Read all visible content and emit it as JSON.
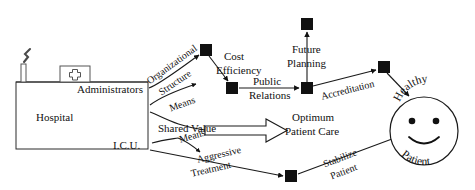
{
  "diagram": {
    "type": "causal-flow-diagram",
    "background_color": "#ffffff",
    "line_color": "#1a1a1a",
    "node_color": "#111111",
    "building": {
      "name": "hospital-building",
      "label": "Hospital",
      "departments": [
        {
          "key": "administrators",
          "label": "Administrators"
        },
        {
          "key": "icu",
          "label": "I.C.U."
        }
      ],
      "roof_sign_label": "cross-sign",
      "chimney_label": "chimney-with-smoke"
    },
    "nodes": [
      {
        "id": "n1",
        "name": "node-organizational-structure",
        "x": 206,
        "y": 50
      },
      {
        "id": "n2",
        "name": "node-cost-efficiency",
        "x": 232,
        "y": 88
      },
      {
        "id": "n3",
        "name": "node-public-relations",
        "x": 307,
        "y": 88
      },
      {
        "id": "n4",
        "name": "node-future-planning",
        "x": 307,
        "y": 24
      },
      {
        "id": "n5",
        "name": "node-accreditation",
        "x": 384,
        "y": 67
      },
      {
        "id": "n6",
        "name": "node-aggressive-treatment",
        "x": 291,
        "y": 176
      }
    ],
    "edge_labels": [
      {
        "key": "organizational_structure",
        "line1": "Organizational",
        "line2": "Structure"
      },
      {
        "key": "means_upper",
        "text": "Means"
      },
      {
        "key": "cost_efficiency",
        "line1": "Cost",
        "line2": "Efficiency"
      },
      {
        "key": "public_relations",
        "line1": "Public",
        "line2": "Relations"
      },
      {
        "key": "future_planning",
        "line1": "Future",
        "line2": "Planning"
      },
      {
        "key": "accreditation",
        "text": "Accreditation"
      },
      {
        "key": "shared_value",
        "text": "Shared Value"
      },
      {
        "key": "optimum_patient_care",
        "line1": "Optimum",
        "line2": "Patient Care"
      },
      {
        "key": "means_lower",
        "text": "Means"
      },
      {
        "key": "aggressive_treatment",
        "line1": "Aggressive",
        "line2": "Treatment"
      },
      {
        "key": "stabilize_patient",
        "line1": "Stabilize",
        "line2": "Patient"
      }
    ],
    "outcome": {
      "name": "patient-outcome",
      "face_label": "smiley-face",
      "top_label": "Healthy",
      "bottom_label": "Patient"
    }
  }
}
